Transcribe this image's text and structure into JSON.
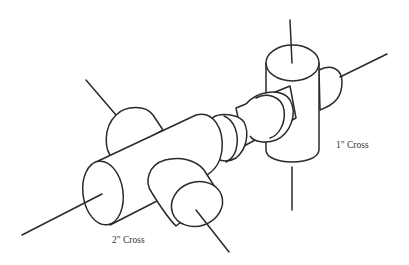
{
  "diagram": {
    "type": "isometric pipe fitting sketch",
    "colors": {
      "line": "#2a2a2a",
      "background": "#ffffff",
      "label": "#333333"
    },
    "components": [
      {
        "id": "cross-2in",
        "label": "2\" Cross"
      },
      {
        "id": "reducer",
        "label": ""
      },
      {
        "id": "cross-1in",
        "label": "1\" Cross"
      }
    ],
    "labels": {
      "cross_2in": "2\" Cross",
      "cross_1in": "1\" Cross"
    }
  }
}
